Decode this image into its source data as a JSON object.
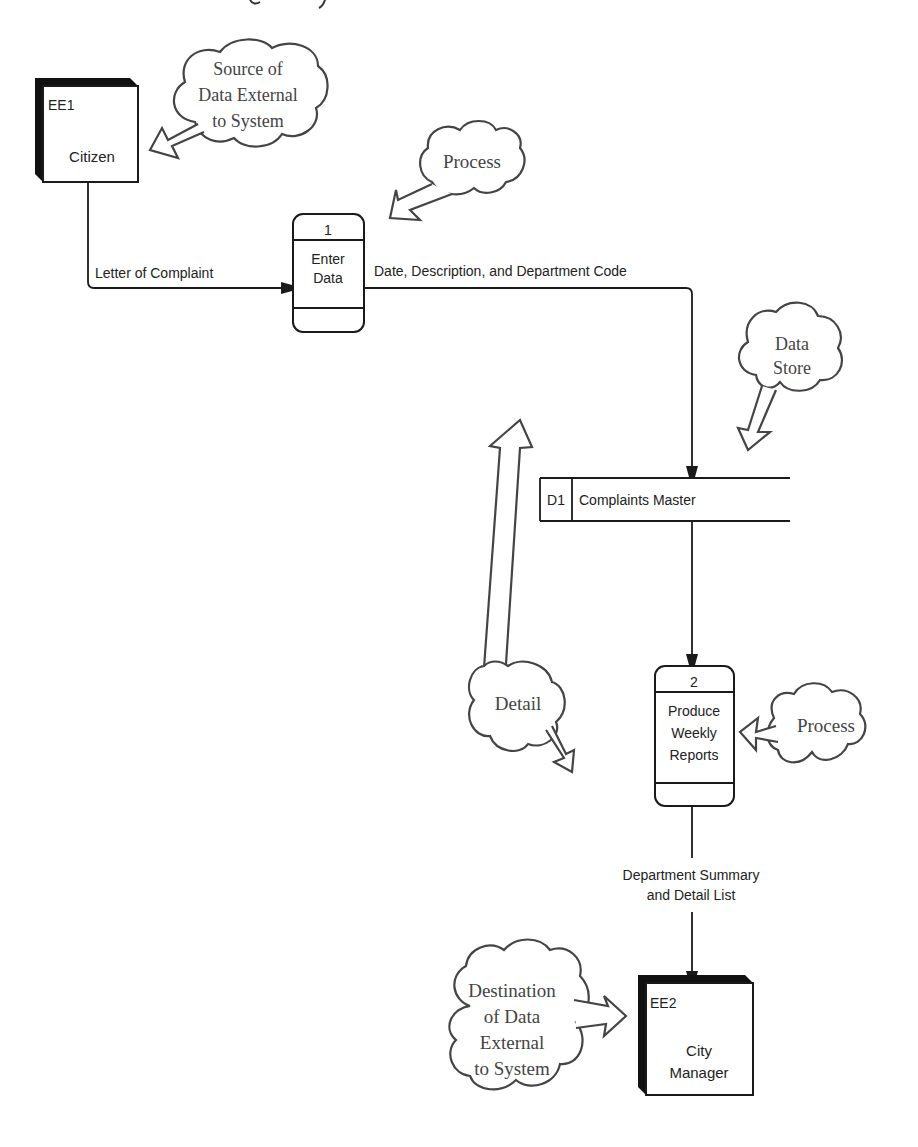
{
  "diagram": {
    "type": "data-flow-diagram",
    "title_fragment": "",
    "external_entities": [
      {
        "id": "EE1",
        "label": "Citizen"
      },
      {
        "id": "EE2",
        "label_line1": "City",
        "label_line2": "Manager"
      }
    ],
    "processes": [
      {
        "number": "1",
        "line1": "Enter",
        "line2": "Data"
      },
      {
        "number": "2",
        "line1": "Produce",
        "line2": "Weekly",
        "line3": "Reports"
      }
    ],
    "data_stores": [
      {
        "id": "D1",
        "label": "Complaints Master"
      }
    ],
    "flows": [
      {
        "label": "Letter of Complaint",
        "from": "EE1",
        "to": "1"
      },
      {
        "label": "Date, Description, and Department Code",
        "from": "1",
        "to": "D1"
      },
      {
        "label": "",
        "from": "D1",
        "to": "2"
      },
      {
        "label_line1": "Department Summary",
        "label_line2": "and Detail List",
        "from": "2",
        "to": "EE2"
      }
    ],
    "callouts": [
      {
        "name": "source",
        "line1": "Source of",
        "line2": "Data External",
        "line3": "to System"
      },
      {
        "name": "process-1",
        "text": "Process"
      },
      {
        "name": "data-store",
        "line1": "Data",
        "line2": "Store"
      },
      {
        "name": "detail",
        "text": "Detail"
      },
      {
        "name": "process-2",
        "text": "Process"
      },
      {
        "name": "destination",
        "line1": "Destination",
        "line2": "of Data",
        "line3": "External",
        "line4": "to System"
      }
    ],
    "colors": {
      "ink": "#1a1a1a",
      "callout_ink": "#444444",
      "background": "#ffffff"
    }
  }
}
